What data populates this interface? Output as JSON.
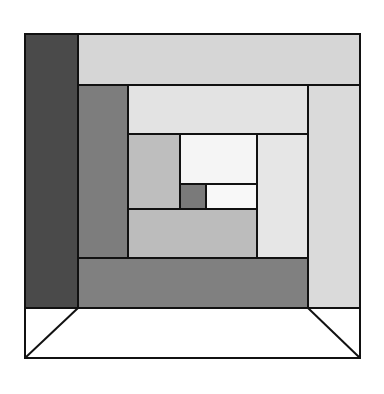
{
  "diagram": {
    "title": "",
    "stroke_color": "#111111",
    "blocks": [
      {
        "id": "outer-left-column",
        "x": 25,
        "y": 34,
        "w": 53,
        "h": 274,
        "fill": "#4a4a4a"
      },
      {
        "id": "outer-top-band",
        "x": 78,
        "y": 34,
        "w": 282,
        "h": 51,
        "fill": "#d6d6d6"
      },
      {
        "id": "outer-right-column",
        "x": 308,
        "y": 85,
        "w": 52,
        "h": 223,
        "fill": "#dadada"
      },
      {
        "id": "ring2-left-column",
        "x": 78,
        "y": 85,
        "w": 50,
        "h": 173,
        "fill": "#7d7d7d"
      },
      {
        "id": "ring2-bottom-band",
        "x": 78,
        "y": 258,
        "w": 230,
        "h": 50,
        "fill": "#808080"
      },
      {
        "id": "ring2-top-band",
        "x": 128,
        "y": 85,
        "w": 180,
        "h": 49,
        "fill": "#e3e3e3"
      },
      {
        "id": "ring3-left-column",
        "x": 128,
        "y": 134,
        "w": 52,
        "h": 75,
        "fill": "#bebebe"
      },
      {
        "id": "ring3-right-column",
        "x": 257,
        "y": 134,
        "w": 51,
        "h": 124,
        "fill": "#e6e6e6"
      },
      {
        "id": "ring3-bottom-band",
        "x": 128,
        "y": 209,
        "w": 129,
        "h": 49,
        "fill": "#bcbcbc"
      },
      {
        "id": "center-top-block",
        "x": 180,
        "y": 134,
        "w": 77,
        "h": 50,
        "fill": "#f5f5f5"
      },
      {
        "id": "center-dark-square",
        "x": 180,
        "y": 184,
        "w": 26,
        "h": 25,
        "fill": "#7a7a7a"
      },
      {
        "id": "center-white-block",
        "x": 206,
        "y": 184,
        "w": 51,
        "h": 25,
        "fill": "#f8f8f8"
      }
    ],
    "tray": {
      "outer": {
        "x": 25,
        "y": 308,
        "w": 335,
        "h": 50
      },
      "inner_left_x": 78,
      "inner_right_x": 308,
      "fill": "#ffffff"
    }
  }
}
